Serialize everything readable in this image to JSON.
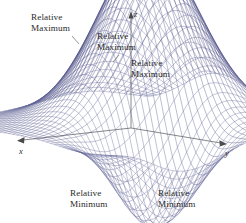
{
  "figure": {
    "background_color": "#ffffff",
    "mesh_color": "#5b5f95",
    "mesh_color_dark": "#3c3f73",
    "axis_color": "#5a5a5a",
    "text_color": "#2b2b2b"
  },
  "axes": {
    "x": {
      "label": "x",
      "direction": "down-left",
      "arrow": true
    },
    "y": {
      "label": "y",
      "direction": "down-right",
      "arrow": true
    },
    "z": {
      "label": "z",
      "direction": "up",
      "arrow": true
    }
  },
  "callouts": [
    {
      "id": "max-1",
      "line1": "Relative",
      "line2": "Maximum",
      "leader": true
    },
    {
      "id": "max-2",
      "line1": "Relative",
      "line2": "Maximum",
      "leader": true
    },
    {
      "id": "max-3",
      "line1": "Relative",
      "line2": "Maximum",
      "leader": true
    },
    {
      "id": "min-1",
      "line1": "Relative",
      "line2": "Minimum",
      "leader": false
    },
    {
      "id": "min-2",
      "line1": "Relative",
      "line2": "Minimum",
      "leader": false
    }
  ],
  "chart_data": {
    "type": "surface",
    "title": "",
    "xlabel": "x",
    "ylabel": "y",
    "zlabel": "z",
    "grid": true,
    "legend": false,
    "projection": "3d-wireframe",
    "mesh_resolution": {
      "u": 44,
      "v": 44
    },
    "features": [
      {
        "kind": "relative maximum",
        "label": "Relative Maximum",
        "screen_xy": [
          88,
          48
        ],
        "relative_height": 1.0
      },
      {
        "kind": "relative maximum",
        "label": "Relative Maximum",
        "screen_xy": [
          103,
          58
        ],
        "relative_height": 0.86
      },
      {
        "kind": "relative maximum",
        "label": "Relative Maximum",
        "screen_xy": [
          127,
          76
        ],
        "relative_height": 0.62
      },
      {
        "kind": "relative minimum",
        "label": "Relative Minimum",
        "screen_xy": [
          117,
          184
        ],
        "relative_height": -0.78
      },
      {
        "kind": "relative minimum",
        "label": "Relative Minimum",
        "screen_xy": [
          152,
          184
        ],
        "relative_height": -0.8
      }
    ],
    "peak_count": 3,
    "well_count": 2
  }
}
